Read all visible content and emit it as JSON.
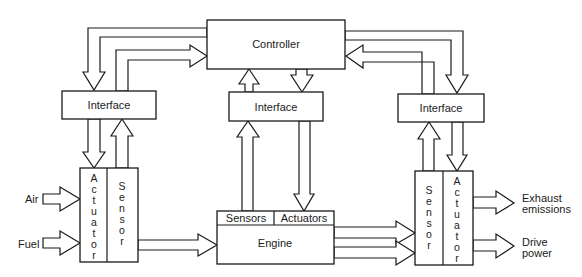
{
  "diagram": {
    "type": "block-diagram",
    "blocks": {
      "controller": {
        "label": "Controller"
      },
      "interface_left": {
        "label": "Interface"
      },
      "interface_center": {
        "label": "Interface"
      },
      "interface_right": {
        "label": "Interface"
      },
      "left_actuator": {
        "label": "Actuator",
        "letters": [
          "A",
          "c",
          "t",
          "u",
          "a",
          "t",
          "o",
          "r"
        ]
      },
      "left_sensor": {
        "label": "Sensor",
        "letters": [
          "S",
          "e",
          "n",
          "s",
          "o",
          "r"
        ]
      },
      "engine": {
        "label": "Engine",
        "sensors": "Sensors",
        "actuators": "Actuators"
      },
      "right_sensor": {
        "label": "Sensor",
        "letters": [
          "S",
          "e",
          "n",
          "s",
          "o",
          "r"
        ]
      },
      "right_actuator": {
        "label": "Actuator",
        "letters": [
          "A",
          "c",
          "t",
          "u",
          "a",
          "t",
          "o",
          "r"
        ]
      }
    },
    "inputs": {
      "air": "Air",
      "fuel": "Fuel"
    },
    "outputs": {
      "exhaust_line1": "Exhaust",
      "exhaust_line2": "emissions",
      "drive_line1": "Drive",
      "drive_line2": "power"
    },
    "connections": [
      {
        "from": "Controller",
        "to": "Interface (left)"
      },
      {
        "from": "Interface (left)",
        "to": "Controller"
      },
      {
        "from": "Interface (center)",
        "to": "Controller"
      },
      {
        "from": "Controller",
        "to": "Interface (center)"
      },
      {
        "from": "Controller",
        "to": "Interface (right)"
      },
      {
        "from": "Interface (right)",
        "to": "Controller"
      },
      {
        "from": "Interface (left)",
        "to": "Actuator (left)"
      },
      {
        "from": "Sensor (left)",
        "to": "Interface (left)"
      },
      {
        "from": "Engine Sensors",
        "to": "Interface (center)"
      },
      {
        "from": "Interface (center)",
        "to": "Engine Actuators"
      },
      {
        "from": "Sensor (right)",
        "to": "Interface (right)"
      },
      {
        "from": "Interface (right)",
        "to": "Actuator (right)"
      },
      {
        "from": "Air",
        "to": "Actuator (left)"
      },
      {
        "from": "Fuel",
        "to": "Actuator (left)"
      },
      {
        "from": "Sensor (left)",
        "to": "Engine"
      },
      {
        "from": "Engine",
        "to": "Sensor (right)"
      },
      {
        "from": "Engine",
        "to": "Sensor (right)"
      },
      {
        "from": "Actuator (right)",
        "to": "Exhaust emissions"
      },
      {
        "from": "Actuator (right)",
        "to": "Drive power"
      }
    ]
  }
}
